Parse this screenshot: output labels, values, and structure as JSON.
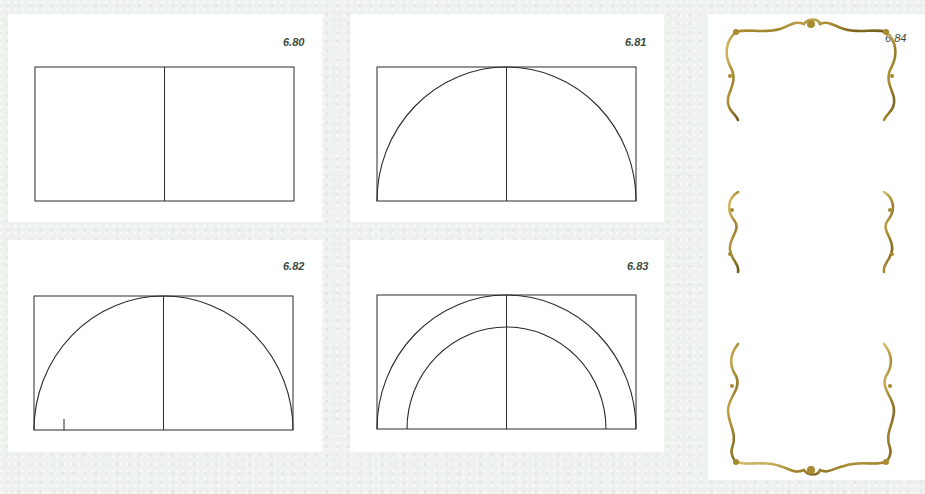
{
  "figures": [
    {
      "id": "fig-680",
      "label": "6.80",
      "description": "Rectangle divided by vertical centerline"
    },
    {
      "id": "fig-681",
      "label": "6.81",
      "description": "Rectangle with semicircle inscribed on base"
    },
    {
      "id": "fig-682",
      "label": "6.82",
      "description": "Semicircle with tick mark on base line"
    },
    {
      "id": "fig-683",
      "label": "6.83",
      "description": "Concentric semicircles forming an arch band"
    },
    {
      "id": "fig-684",
      "label": "6.84",
      "description": "Ornate gilded rococo frame"
    }
  ],
  "colors": {
    "background": "#eef2ee",
    "panel": "#ffffff",
    "line": "#2a2a2a",
    "label": "#3a4a3a",
    "gold": "#b89a3a",
    "gold_dark": "#7a6420"
  }
}
